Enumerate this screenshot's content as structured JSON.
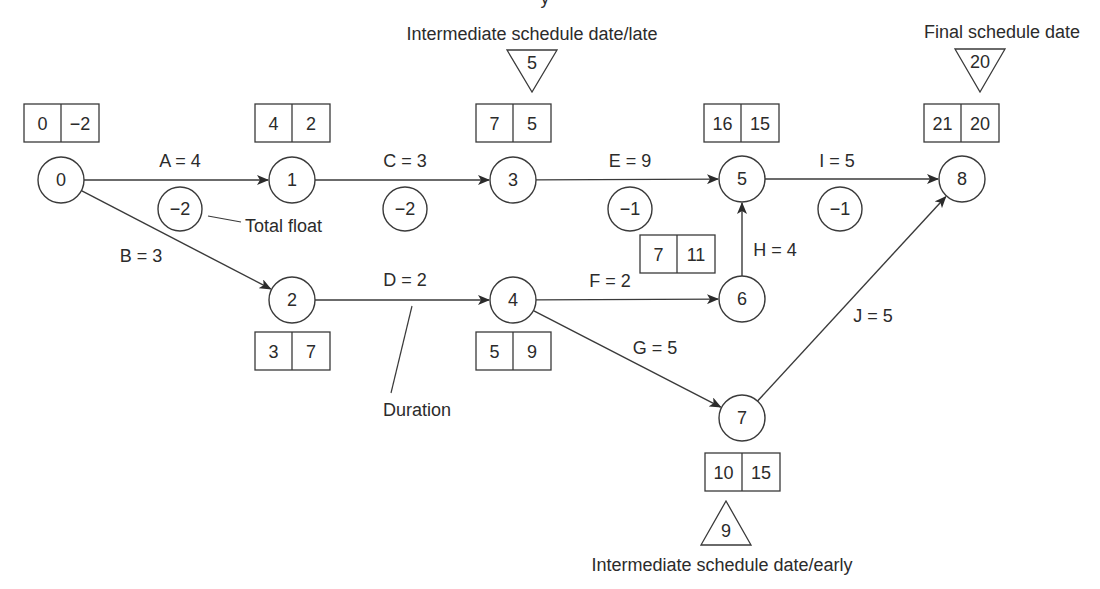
{
  "colors": {
    "stroke": "#3a3a3a",
    "text": "#2b2b2b",
    "background": "#ffffff"
  },
  "annotations": {
    "top_partial": "y",
    "intermediate_late": "Intermediate schedule date/late",
    "final": "Final schedule date",
    "intermediate_early": "Intermediate schedule date/early",
    "total_float": "Total float",
    "duration": "Duration"
  },
  "nodes": [
    {
      "id": "0",
      "label": "0",
      "x": 61,
      "y": 180
    },
    {
      "id": "1",
      "label": "1",
      "x": 292,
      "y": 180
    },
    {
      "id": "2",
      "label": "2",
      "x": 292,
      "y": 300
    },
    {
      "id": "3",
      "label": "3",
      "x": 513,
      "y": 180
    },
    {
      "id": "4",
      "label": "4",
      "x": 513,
      "y": 300
    },
    {
      "id": "5",
      "label": "5",
      "x": 742,
      "y": 179
    },
    {
      "id": "6",
      "label": "6",
      "x": 742,
      "y": 299
    },
    {
      "id": "7",
      "label": "7",
      "x": 742,
      "y": 418
    },
    {
      "id": "8",
      "label": "8",
      "x": 962,
      "y": 179
    }
  ],
  "edges": [
    {
      "id": "A",
      "label": "A = 4",
      "from": "0",
      "to": "1",
      "lx": 180,
      "ly": 167,
      "float": "−2",
      "fx": 180,
      "fy": 209
    },
    {
      "id": "B",
      "label": "B = 3",
      "from": "0",
      "to": "2",
      "lx": 141,
      "ly": 262
    },
    {
      "id": "C",
      "label": "C = 3",
      "from": "1",
      "to": "3",
      "lx": 405,
      "ly": 167,
      "float": "−2",
      "fx": 405,
      "fy": 209
    },
    {
      "id": "D",
      "label": "D = 2",
      "from": "2",
      "to": "4",
      "lx": 405,
      "ly": 286
    },
    {
      "id": "E",
      "label": "E = 9",
      "from": "3",
      "to": "5",
      "lx": 630,
      "ly": 167,
      "float": "−1",
      "fx": 630,
      "fy": 209
    },
    {
      "id": "F",
      "label": "F = 2",
      "from": "4",
      "to": "6",
      "lx": 610,
      "ly": 287
    },
    {
      "id": "G",
      "label": "G = 5",
      "from": "4",
      "to": "7",
      "lx": 655,
      "ly": 354
    },
    {
      "id": "H",
      "label": "H = 4",
      "from": "6",
      "to": "5",
      "lx": 775,
      "ly": 256
    },
    {
      "id": "I",
      "label": "I = 5",
      "from": "5",
      "to": "8",
      "lx": 837,
      "ly": 167,
      "float": "−1",
      "fx": 840,
      "fy": 209
    },
    {
      "id": "J",
      "label": "J = 5",
      "from": "7",
      "to": "8",
      "lx": 873,
      "ly": 322
    }
  ],
  "boxes": [
    {
      "node": "0",
      "left": "0",
      "right": "−2",
      "x": 24,
      "y": 104
    },
    {
      "node": "1",
      "left": "4",
      "right": "2",
      "x": 255,
      "y": 104
    },
    {
      "node": "3",
      "left": "7",
      "right": "5",
      "x": 476,
      "y": 104
    },
    {
      "node": "5",
      "left": "16",
      "right": "15",
      "x": 704,
      "y": 104
    },
    {
      "node": "8",
      "left": "21",
      "right": "20",
      "x": 924,
      "y": 104
    },
    {
      "node": "6",
      "left": "7",
      "right": "11",
      "x": 640,
      "y": 235
    },
    {
      "node": "2",
      "left": "3",
      "right": "7",
      "x": 255,
      "y": 332
    },
    {
      "node": "4",
      "left": "5",
      "right": "9",
      "x": 476,
      "y": 332
    },
    {
      "node": "7",
      "left": "10",
      "right": "15",
      "x": 705,
      "y": 453
    }
  ],
  "milestones": [
    {
      "type": "late",
      "value": "5",
      "cx": 532,
      "top": 50,
      "bottom": 92,
      "half": 25
    },
    {
      "type": "final",
      "value": "20",
      "cx": 980,
      "top": 49,
      "bottom": 92,
      "half": 25
    },
    {
      "type": "early",
      "value": "9",
      "cx": 726,
      "top": 501,
      "bottom": 545,
      "half": 25
    }
  ]
}
